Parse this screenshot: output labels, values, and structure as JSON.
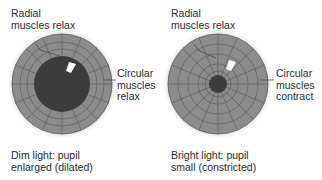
{
  "colors": {
    "iris": "#8c8c8c",
    "iris_lines": "#555555",
    "pupil": "#3c3c3c",
    "highlight": "#ffffff",
    "text": "#2a2a2a"
  },
  "panels": [
    {
      "id": "dim",
      "top_label": [
        "Radial",
        "muscles relax"
      ],
      "side_label": [
        "Circular",
        "muscles",
        "relax"
      ],
      "caption": [
        "Dim light: pupil",
        "enlarged (dilated)"
      ],
      "pupil_state": "dilated"
    },
    {
      "id": "bright",
      "top_label": [
        "Radial",
        "muscles relax"
      ],
      "side_label": [
        "Circular",
        "muscles",
        "contract"
      ],
      "caption": [
        "Bright light: pupil",
        "small (constricted)"
      ],
      "pupil_state": "constricted"
    }
  ]
}
